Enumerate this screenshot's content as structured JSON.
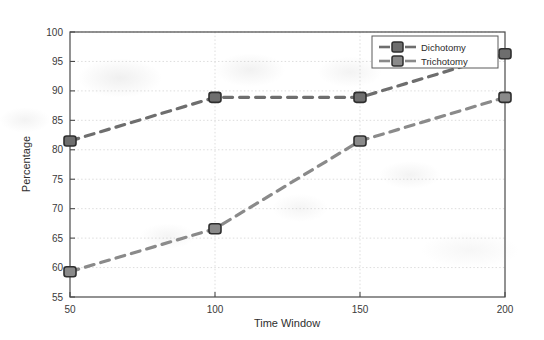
{
  "chart_data": {
    "type": "line",
    "title": "",
    "xlabel": "Time Window",
    "ylabel": "Percentage",
    "x": [
      50,
      100,
      150,
      200
    ],
    "xtick_labels": [
      "50",
      "100",
      "150",
      "200"
    ],
    "ytick_labels": [
      "55",
      "60",
      "65",
      "70",
      "75",
      "80",
      "85",
      "90",
      "95",
      "100"
    ],
    "yticks": [
      55,
      60,
      65,
      70,
      75,
      80,
      85,
      90,
      95,
      100
    ],
    "xlim": [
      50,
      200
    ],
    "ylim": [
      55,
      100
    ],
    "grid": true,
    "legend_position": "upper right",
    "series": [
      {
        "name": "Dichotomy",
        "values": [
          81.5,
          88.9,
          88.9,
          96.3
        ],
        "color": "#6e6e6e",
        "marker": "square",
        "linestyle": "dashed"
      },
      {
        "name": "Trichotomy",
        "values": [
          59.3,
          66.6,
          81.5,
          88.9
        ],
        "color": "#8a8a8a",
        "marker": "square",
        "linestyle": "dashed"
      }
    ]
  },
  "legend": {
    "entries": [
      "Dichotomy",
      "Trichotomy"
    ]
  },
  "axes": {
    "x_title": "Time Window",
    "y_title": "Percentage"
  },
  "colors": {
    "axis": "#4a4a4a",
    "grid": "#cfcfcf",
    "series_1": "#6e6e6e",
    "series_2": "#8a8a8a",
    "text": "#2e2e2e",
    "background": "#ffffff"
  }
}
